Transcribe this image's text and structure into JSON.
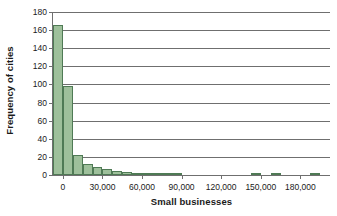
{
  "chart_data": {
    "type": "bar",
    "title": "",
    "subtitle": "",
    "xlabel": "Small businesses",
    "ylabel": "Frequency of cities",
    "xlim": [
      -7500,
      202500
    ],
    "ylim": [
      0,
      180
    ],
    "xticks": [
      0,
      30000,
      60000,
      90000,
      120000,
      150000,
      180000
    ],
    "xtick_labels": [
      "0",
      "30,000",
      "60,000",
      "90,000",
      "120,000",
      "150,000",
      "180,000"
    ],
    "yticks": [
      0,
      20,
      40,
      60,
      80,
      100,
      120,
      140,
      160,
      180
    ],
    "ytick_labels": [
      "0",
      "20",
      "40",
      "60",
      "80",
      "100",
      "120",
      "140",
      "160",
      "180"
    ],
    "grid": "horizontal",
    "legend": "none",
    "bin_width": 7500,
    "bar_color": "#9ec09b",
    "bar_edge_color": "#4f7a55",
    "axis_color": "#6f6f6f",
    "bins": [
      {
        "start": -7500,
        "end": 0,
        "center": -3750,
        "value": 166
      },
      {
        "start": 0,
        "end": 7500,
        "center": 3750,
        "value": 98
      },
      {
        "start": 7500,
        "end": 15000,
        "center": 11250,
        "value": 22
      },
      {
        "start": 15000,
        "end": 22500,
        "center": 18750,
        "value": 12
      },
      {
        "start": 22500,
        "end": 30000,
        "center": 26250,
        "value": 9
      },
      {
        "start": 30000,
        "end": 37500,
        "center": 33750,
        "value": 7
      },
      {
        "start": 37500,
        "end": 45000,
        "center": 41250,
        "value": 4
      },
      {
        "start": 45000,
        "end": 52500,
        "center": 48750,
        "value": 3
      },
      {
        "start": 52500,
        "end": 60000,
        "center": 56250,
        "value": 2
      },
      {
        "start": 60000,
        "end": 67500,
        "center": 63750,
        "value": 2
      },
      {
        "start": 67500,
        "end": 75000,
        "center": 71250,
        "value": 1
      },
      {
        "start": 75000,
        "end": 82500,
        "center": 78750,
        "value": 1
      },
      {
        "start": 82500,
        "end": 90000,
        "center": 86250,
        "value": 1
      },
      {
        "start": 142500,
        "end": 150000,
        "center": 146250,
        "value": 1
      },
      {
        "start": 157500,
        "end": 165000,
        "center": 161250,
        "value": 1
      },
      {
        "start": 187500,
        "end": 195000,
        "center": 191250,
        "value": 1
      }
    ]
  }
}
